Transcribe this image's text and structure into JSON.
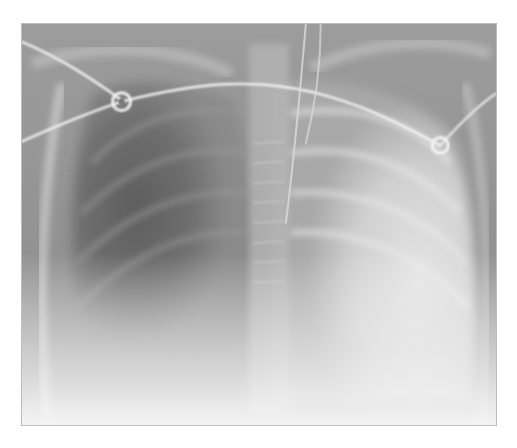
{
  "image": {
    "subject": "Frontal chest radiograph",
    "description": "Chest X-ray showing hyperlucent right hemithorax (image left) with dense opacification of left hemithorax (image right), mediastinal shift, support lines and ECG electrodes",
    "palette": {
      "background": "#ffffff",
      "dark_lung": "#6a6a6a",
      "soft_tissue": "#9a9a9a",
      "dense_opacity": "#d8d8d8",
      "wire": "#eeeeee"
    }
  }
}
